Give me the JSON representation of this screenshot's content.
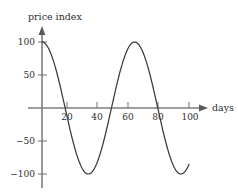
{
  "chart_data": {
    "type": "line",
    "title": "",
    "xlabel": "days",
    "ylabel": "price index",
    "xlim": [
      0,
      104
    ],
    "ylim": [
      -115,
      112
    ],
    "xticks": [
      20,
      40,
      60,
      80,
      100
    ],
    "xticklabels": [
      "20",
      "40",
      "60",
      "80",
      "100"
    ],
    "yticks": [
      100,
      50,
      -50,
      -100
    ],
    "yticklabels": [
      "100",
      "50",
      "−50",
      "−100"
    ],
    "grid": false,
    "legend": null,
    "annotations": [],
    "series": [
      {
        "name": "price index",
        "amplitude": 100,
        "period_days": 63,
        "phase": "cosine",
        "x": [
          0,
          4,
          8,
          12,
          16,
          20,
          24,
          28,
          32,
          36,
          40,
          44,
          48,
          52,
          56,
          60,
          64,
          68,
          72,
          76,
          80,
          84,
          88,
          92,
          96,
          100
        ],
        "values": [
          100,
          92,
          70,
          37,
          0,
          -37,
          -70,
          -92,
          -100,
          -92,
          -70,
          -37,
          0,
          37,
          70,
          92,
          100,
          92,
          70,
          37,
          0,
          -37,
          -70,
          -92,
          -100,
          -55
        ]
      }
    ],
    "key_points": {
      "start": {
        "x": 0,
        "y": 100
      },
      "first_zero_down": {
        "x": 16,
        "y": 0
      },
      "first_trough": {
        "x": 32,
        "y": -100
      },
      "second_zero_up": {
        "x": 44,
        "y": 0
      },
      "peak": {
        "x": 59,
        "y": 97
      },
      "third_zero_down": {
        "x": 74,
        "y": 0
      },
      "second_trough": {
        "x": 90,
        "y": -100
      },
      "end": {
        "x": 100,
        "y": -55
      }
    }
  },
  "axes": {
    "y_axis_label": "price index",
    "x_axis_label": "days"
  },
  "icons": {
    "x_arrow": "arrow-right-icon",
    "y_arrow": "arrow-up-icon"
  },
  "colors": {
    "curve": "#3a3a3a",
    "axis": "#7d7d7d",
    "text": "#2e2e2e",
    "background": "#ffffff"
  }
}
